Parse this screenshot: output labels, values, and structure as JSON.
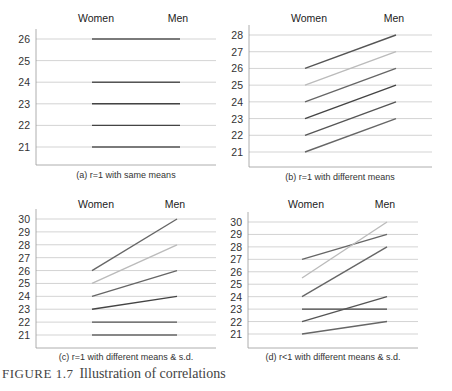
{
  "figure": {
    "label": "FIGURE 1.7",
    "title": "Illustration of correlations"
  },
  "chart_data": [
    {
      "type": "line",
      "panel": "a",
      "caption": "(a) r=1 with same means",
      "categories": [
        "Women",
        "Men"
      ],
      "yticks": [
        21,
        22,
        23,
        24,
        25,
        26
      ],
      "ylim": [
        20.2,
        26.3
      ],
      "grid": true,
      "series": [
        {
          "values": [
            26,
            26
          ],
          "color": "#555555"
        },
        {
          "values": [
            24,
            24
          ],
          "color": "#555555"
        },
        {
          "values": [
            23,
            23
          ],
          "color": "#444444"
        },
        {
          "values": [
            22,
            22
          ],
          "color": "#444444"
        },
        {
          "values": [
            21,
            21
          ],
          "color": "#555555"
        }
      ]
    },
    {
      "type": "line",
      "panel": "b",
      "caption": "(b) r=1 with different means",
      "categories": [
        "Women",
        "Men"
      ],
      "yticks": [
        21,
        22,
        23,
        24,
        25,
        26,
        27,
        28
      ],
      "ylim": [
        20.1,
        28.3
      ],
      "grid": true,
      "series": [
        {
          "values": [
            26,
            28
          ],
          "color": "#555555"
        },
        {
          "values": [
            25,
            27
          ],
          "color": "#bbbbbb"
        },
        {
          "values": [
            24,
            26
          ],
          "color": "#666666"
        },
        {
          "values": [
            23,
            25
          ],
          "color": "#444444"
        },
        {
          "values": [
            22,
            24
          ],
          "color": "#555555"
        },
        {
          "values": [
            21,
            23
          ],
          "color": "#666666"
        }
      ]
    },
    {
      "type": "line",
      "panel": "c",
      "caption": "(c) r=1 with different means & s.d.",
      "categories": [
        "Women",
        "Men"
      ],
      "yticks": [
        21,
        22,
        23,
        24,
        25,
        26,
        27,
        28,
        29,
        30
      ],
      "ylim": [
        20.0,
        30.3
      ],
      "grid": true,
      "series": [
        {
          "values": [
            26,
            30
          ],
          "color": "#666666"
        },
        {
          "values": [
            25,
            28
          ],
          "color": "#bbbbbb"
        },
        {
          "values": [
            24,
            26
          ],
          "color": "#666666"
        },
        {
          "values": [
            23,
            24
          ],
          "color": "#444444"
        },
        {
          "values": [
            22,
            22
          ],
          "color": "#555555"
        },
        {
          "values": [
            21,
            21
          ],
          "color": "#666666"
        }
      ]
    },
    {
      "type": "line",
      "panel": "d",
      "caption": "(d) r<1 with different means & s.d.",
      "categories": [
        "Women",
        "Men"
      ],
      "yticks": [
        21,
        22,
        23,
        24,
        25,
        26,
        27,
        28,
        29,
        30
      ],
      "ylim": [
        20.0,
        30.3
      ],
      "grid": true,
      "series": [
        {
          "values": [
            27,
            29
          ],
          "color": "#666666"
        },
        {
          "values": [
            25.5,
            30
          ],
          "color": "#bbbbbb"
        },
        {
          "values": [
            24,
            28
          ],
          "color": "#666666"
        },
        {
          "values": [
            23,
            23
          ],
          "color": "#444444"
        },
        {
          "values": [
            22,
            24
          ],
          "color": "#555555"
        },
        {
          "values": [
            21,
            22
          ],
          "color": "#666666"
        }
      ]
    }
  ]
}
